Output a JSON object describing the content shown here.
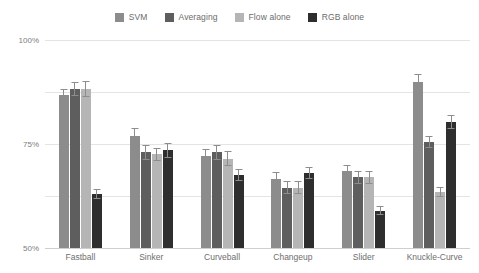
{
  "chart_data": {
    "type": "bar",
    "title": "",
    "subtitle": "",
    "xlabel": "",
    "ylabel": "",
    "grid": true,
    "legend_position": "top-center",
    "ylim": [
      0,
      100
    ],
    "yticks": [
      "0%",
      "25%",
      "50%",
      "75%",
      "100%"
    ],
    "ytick_values": [
      0,
      25,
      50,
      75,
      100
    ],
    "categories": [
      "Fastball",
      "Sinker",
      "Curveball",
      "Changeup",
      "Slider",
      "Knuckle-Curve"
    ],
    "series": [
      {
        "name": "SVM",
        "color": "#8c8c8c",
        "values": [
          73.5,
          54.0,
          44.0,
          33.0,
          37.0,
          80.0
        ],
        "errors": [
          3.0,
          3.5,
          3.5,
          3.5,
          3.0,
          3.5
        ]
      },
      {
        "name": "Averaging",
        "color": "#5e5e5e",
        "values": [
          76.5,
          46.0,
          46.0,
          29.0,
          34.0,
          51.0
        ],
        "errors": [
          3.5,
          3.5,
          3.5,
          3.0,
          3.0,
          3.0
        ]
      },
      {
        "name": "Flow alone",
        "color": "#b5b5b5",
        "values": [
          76.5,
          45.0,
          43.0,
          29.0,
          34.0,
          27.0
        ],
        "errors": [
          4.0,
          3.0,
          3.5,
          3.0,
          3.0,
          2.5
        ]
      },
      {
        "name": "RGB alone",
        "color": "#2e2e2e",
        "values": [
          26.0,
          47.0,
          35.0,
          36.0,
          18.0,
          60.5
        ],
        "errors": [
          2.5,
          3.5,
          3.0,
          3.0,
          2.0,
          3.5
        ]
      }
    ]
  },
  "axis": {
    "tick_color": "#7d7d7d",
    "grid_color": "#e4e4e4",
    "baseline_color": "#cfcfcf"
  }
}
